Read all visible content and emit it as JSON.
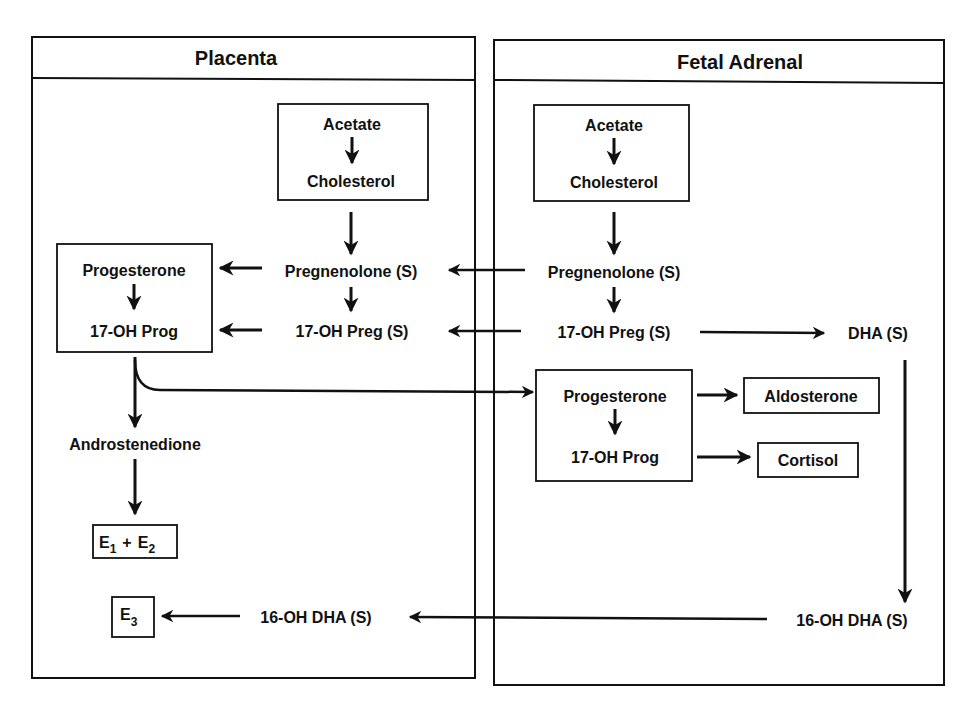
{
  "panels": {
    "placenta": {
      "title": "Placenta"
    },
    "fetal_adrenal": {
      "title": "Fetal Adrenal"
    }
  },
  "placenta": {
    "precursor_box": {
      "top": "Acetate",
      "bottom": "Cholesterol"
    },
    "pregnenolone": "Pregnenolone (S)",
    "oh17_preg": "17-OH Preg (S)",
    "progesterone_box": {
      "top": "Progesterone",
      "bottom": "17-OH Prog"
    },
    "androstenedione": "Androstenedione",
    "e1_e2": {
      "e1": "E",
      "e1_sub": "1",
      "plus": "+",
      "e2": "E",
      "e2_sub": "2"
    },
    "e3": {
      "e": "E",
      "sub": "3"
    },
    "oh16_dha": "16-OH DHA (S)"
  },
  "fetal_adrenal": {
    "precursor_box": {
      "top": "Acetate",
      "bottom": "Cholesterol"
    },
    "pregnenolone": "Pregnenolone (S)",
    "oh17_preg": "17-OH Preg (S)",
    "dha": "DHA (S)",
    "progesterone_box": {
      "top": "Progesterone",
      "bottom": "17-OH Prog"
    },
    "aldosterone": "Aldosterone",
    "cortisol": "Cortisol",
    "oh16_dha": "16-OH DHA (S)"
  },
  "colors": {
    "ink": "#111111",
    "background": "#ffffff"
  }
}
